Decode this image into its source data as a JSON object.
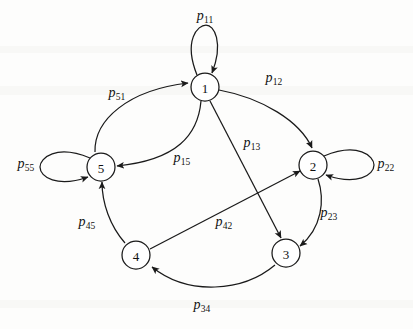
{
  "figure": {
    "type": "state-transition-diagram",
    "background_color": "#fdfdfc",
    "stroke_color": "#1a1a1a"
  },
  "nodes": [
    {
      "id": "1",
      "label": "1",
      "cx": 205,
      "cy": 87,
      "r": 14
    },
    {
      "id": "2",
      "label": "2",
      "cx": 313,
      "cy": 165,
      "r": 14
    },
    {
      "id": "3",
      "label": "3",
      "cx": 286,
      "cy": 253,
      "r": 14
    },
    {
      "id": "4",
      "label": "4",
      "cx": 136,
      "cy": 255,
      "r": 14
    },
    {
      "id": "5",
      "label": "5",
      "cx": 101,
      "cy": 167,
      "r": 14
    }
  ],
  "edges": [
    {
      "name": "p11",
      "from": "1",
      "to": "1",
      "kind": "self-loop",
      "label_p": "p",
      "label_sub": "11",
      "label_x": 205,
      "label_y": 17
    },
    {
      "name": "p22",
      "from": "2",
      "to": "2",
      "kind": "self-loop",
      "label_p": "p",
      "label_sub": "22",
      "label_x": 386,
      "label_y": 165
    },
    {
      "name": "p55",
      "from": "5",
      "to": "5",
      "kind": "self-loop",
      "label_p": "p",
      "label_sub": "55",
      "label_x": 26,
      "label_y": 165
    },
    {
      "name": "p12",
      "from": "1",
      "to": "2",
      "kind": "arc",
      "label_p": "p",
      "label_sub": "12",
      "label_x": 274,
      "label_y": 79
    },
    {
      "name": "p51",
      "from": "5",
      "to": "1",
      "kind": "arc",
      "label_p": "p",
      "label_sub": "51",
      "label_x": 117,
      "label_y": 94
    },
    {
      "name": "p15",
      "from": "1",
      "to": "5",
      "kind": "arc",
      "label_p": "p",
      "label_sub": "15",
      "label_x": 182,
      "label_y": 159
    },
    {
      "name": "p13",
      "from": "1",
      "to": "3",
      "kind": "chord",
      "label_p": "p",
      "label_sub": "13",
      "label_x": 252,
      "label_y": 144
    },
    {
      "name": "p42",
      "from": "4",
      "to": "2",
      "kind": "chord",
      "label_p": "p",
      "label_sub": "42",
      "label_x": 224,
      "label_y": 223
    },
    {
      "name": "p23",
      "from": "2",
      "to": "3",
      "kind": "arc",
      "label_p": "p",
      "label_sub": "23",
      "label_x": 329,
      "label_y": 214
    },
    {
      "name": "p34",
      "from": "3",
      "to": "4",
      "kind": "arc",
      "label_p": "p",
      "label_sub": "34",
      "label_x": 202,
      "label_y": 306
    },
    {
      "name": "p45",
      "from": "4",
      "to": "5",
      "kind": "arc",
      "label_p": "p",
      "label_sub": "45",
      "label_x": 87,
      "label_y": 223
    }
  ]
}
